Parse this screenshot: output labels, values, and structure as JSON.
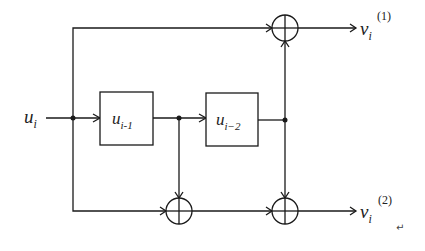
{
  "diagram": {
    "type": "convolutional-encoder",
    "input": {
      "base": "u",
      "sub": "i"
    },
    "registers": [
      {
        "base": "u",
        "sub": "i-1"
      },
      {
        "base": "u",
        "sub": "i−2"
      }
    ],
    "outputs": [
      {
        "base": "v",
        "sub": "i",
        "sup": "(1)"
      },
      {
        "base": "v",
        "sub": "i",
        "sup": "(2)"
      }
    ],
    "adders": [
      "xor-top",
      "xor-bottom-left",
      "xor-bottom-right"
    ],
    "return_mark": "↵",
    "colors": {
      "stroke": "#1a1a1a",
      "background": "#ffffff"
    }
  }
}
